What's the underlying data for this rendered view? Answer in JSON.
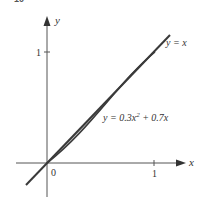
{
  "figure": {
    "number": "10",
    "x_axis_label": "x",
    "y_axis_label": "y",
    "origin_label": "0",
    "x_tick_label": "1",
    "y_tick_label": "1",
    "line_label": "y = x",
    "curve_label_prefix": "y = 0.3x",
    "curve_label_exp": "2",
    "curve_label_suffix": " + 0.7x",
    "colors": {
      "axis": "#555555",
      "curve": "#3a3a3a",
      "shade": "#c8c8c8"
    }
  }
}
